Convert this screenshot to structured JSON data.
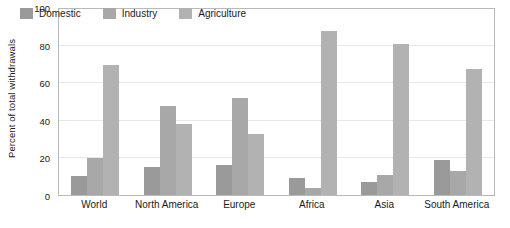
{
  "chart_data": {
    "type": "bar",
    "title": "",
    "xlabel": "",
    "ylabel": "Percent of total withdrawals",
    "ylim": [
      0,
      100
    ],
    "yticks": [
      0,
      20,
      40,
      60,
      80,
      100
    ],
    "grid": true,
    "legend_position": "top-left-inside",
    "categories": [
      "World",
      "North America",
      "Europe",
      "Africa",
      "Asia",
      "South America"
    ],
    "series": [
      {
        "name": "Domestic",
        "color": "#9a9a9a",
        "values": [
          10,
          15,
          16,
          9,
          7,
          19
        ]
      },
      {
        "name": "Industry",
        "color": "#a8a8a8",
        "values": [
          20,
          48,
          52,
          4,
          11,
          13
        ]
      },
      {
        "name": "Agriculture",
        "color": "#b2b2b2",
        "values": [
          70,
          38,
          33,
          88,
          81,
          68
        ]
      }
    ]
  },
  "axes": {
    "y_title": "Percent of total withdrawals",
    "y_tick_labels": [
      "0",
      "20",
      "40",
      "60",
      "80",
      "100"
    ],
    "x_tick_labels": [
      "World",
      "North America",
      "Europe",
      "Africa",
      "Asia",
      "South America"
    ]
  },
  "legend": {
    "items": [
      {
        "label": "Domestic",
        "swatch_color": "#9a9a9a"
      },
      {
        "label": "Industry",
        "swatch_color": "#a8a8a8"
      },
      {
        "label": "Agriculture",
        "swatch_color": "#b2b2b2"
      }
    ]
  },
  "style": {
    "plot_border_color": "#b9b9b9",
    "gridline_color": "#e8e8e8",
    "background": "#ffffff",
    "text_color": "#1a1a1a"
  }
}
